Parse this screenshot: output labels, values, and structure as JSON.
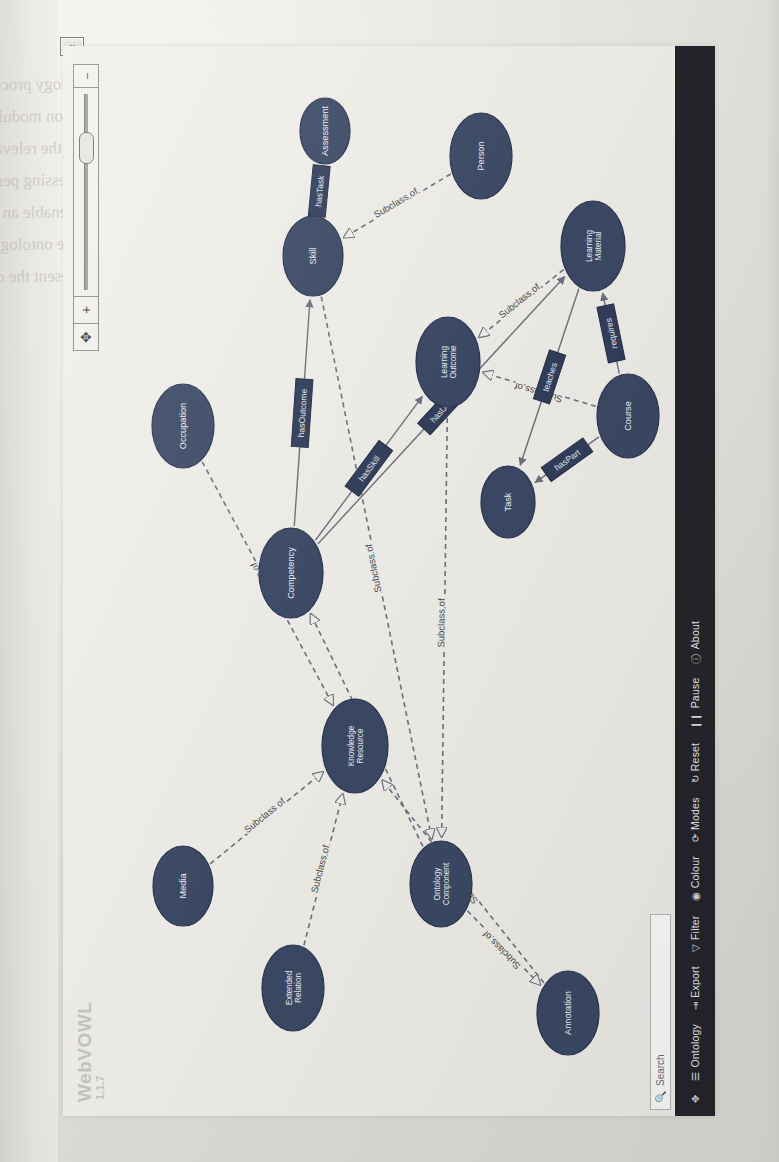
{
  "app": {
    "name": "WebVOWL",
    "version": "1.1.7",
    "collapse_toggle_glyph": "∨"
  },
  "search": {
    "icon": "search-icon",
    "placeholder": "Search",
    "value": ""
  },
  "toolbar": {
    "items": [
      {
        "glyph": "✥",
        "label": "",
        "name": "pan-icon"
      },
      {
        "glyph": "☰",
        "label": "Ontology",
        "name": "ontology"
      },
      {
        "glyph": "⇥",
        "label": "Export",
        "name": "export"
      },
      {
        "glyph": "▽",
        "label": "Filter",
        "name": "filter"
      },
      {
        "glyph": "◉",
        "label": "Colour",
        "name": "colour"
      },
      {
        "glyph": "⟳",
        "label": "Modes",
        "name": "modes"
      },
      {
        "glyph": "↻",
        "label": "Reset",
        "name": "reset"
      },
      {
        "glyph": "❙❙",
        "label": "Pause",
        "name": "pause"
      },
      {
        "glyph": "ⓘ",
        "label": "About",
        "name": "about"
      }
    ]
  },
  "zoom_control": {
    "center_glyph": "✥",
    "plus_label": "+",
    "minus_label": "–",
    "slider_value": 68
  },
  "colors": {
    "class_fill": "#3c4a66",
    "class_stroke": "#2b3550",
    "property_fill": "#33405c",
    "edge": "#6e7280",
    "canvas": "#f2f1ec",
    "sidebar": "#24262b"
  },
  "graph": {
    "edge_label_subclass": "Subclass of",
    "nodes": [
      {
        "id": "n1",
        "label": "Media",
        "cx": 230,
        "cy": 120,
        "rx": 40,
        "ry": 30
      },
      {
        "id": "n2",
        "label": "Extended Relation",
        "cx": 128,
        "cy": 230,
        "rx": 43,
        "ry": 31
      },
      {
        "id": "n3",
        "label": "Ontology Component",
        "cx": 232,
        "cy": 378,
        "rx": 43,
        "ry": 31
      },
      {
        "id": "n4",
        "label": "Annotation",
        "cx": 103,
        "cy": 505,
        "rx": 42,
        "ry": 31
      },
      {
        "id": "n5",
        "label": "Knowledge Resource",
        "cx": 370,
        "cy": 292,
        "rx": 47,
        "ry": 33
      },
      {
        "id": "n6",
        "label": "Competency",
        "cx": 543,
        "cy": 228,
        "rx": 45,
        "ry": 32
      },
      {
        "id": "n7",
        "label": "Occupation",
        "cx": 690,
        "cy": 120,
        "rx": 42,
        "ry": 31
      },
      {
        "id": "n8",
        "label": "Learning Outcome",
        "cx": 754,
        "cy": 385,
        "rx": 45,
        "ry": 32
      },
      {
        "id": "n9",
        "label": "Skill",
        "cx": 860,
        "cy": 250,
        "rx": 40,
        "ry": 30
      },
      {
        "id": "n10",
        "label": "Person",
        "cx": 960,
        "cy": 418,
        "rx": 43,
        "ry": 31
      },
      {
        "id": "n11",
        "label": "Learning Material",
        "cx": 870,
        "cy": 530,
        "rx": 45,
        "ry": 32
      },
      {
        "id": "n12",
        "label": "Course",
        "cx": 700,
        "cy": 565,
        "rx": 42,
        "ry": 31
      },
      {
        "id": "n13",
        "label": "Assessment",
        "cx": 985,
        "cy": 262,
        "rx": 33,
        "ry": 25
      },
      {
        "id": "n14",
        "label": "Task",
        "cx": 614,
        "cy": 445,
        "rx": 36,
        "ry": 27
      }
    ],
    "subclass_edges": [
      {
        "from": "n1",
        "to": "n5",
        "label": "Subclass of"
      },
      {
        "from": "n7",
        "to": "n5",
        "label": "Subclass of"
      },
      {
        "from": "n2",
        "to": "n5",
        "label": "Subclass of"
      },
      {
        "from": "n4",
        "to": "n5",
        "label": "Subclass of"
      },
      {
        "from": "n3",
        "to": "n4",
        "label": "Subclass of"
      },
      {
        "from": "n3",
        "to": "n6",
        "label": "Subclass of"
      },
      {
        "from": "n8",
        "to": "n3",
        "label": "Subclass of"
      },
      {
        "from": "n9",
        "to": "n3",
        "label": "Subclass of"
      },
      {
        "from": "n11",
        "to": "n8",
        "label": "Subclass of"
      },
      {
        "from": "n12",
        "to": "n8",
        "label": "Subclass of"
      },
      {
        "from": "n10",
        "to": "n9",
        "label": "Subclass of"
      },
      {
        "from": "n13",
        "to": "n9",
        "label": "Subclass of"
      }
    ],
    "object_properties": [
      {
        "from": "n6",
        "to": "n8",
        "label": "hasSkill"
      },
      {
        "from": "n6",
        "to": "n9",
        "label": "hasOutcome"
      },
      {
        "from": "n9",
        "to": "n13",
        "label": "hasTask"
      },
      {
        "from": "n12",
        "to": "n11",
        "label": "requires"
      },
      {
        "from": "n11",
        "to": "n14",
        "label": "teaches"
      },
      {
        "from": "n6",
        "to": "n11",
        "label": "hasUnit"
      },
      {
        "from": "n12",
        "to": "n14",
        "label": "hasPart"
      }
    ]
  },
  "ghost_text": [
    {
      "text": "ontology processing. These data now become the",
      "x": 96,
      "y": 74,
      "size": 17
    },
    {
      "text": "pection module. Recommendation impact of the  ontolo",
      "x": 96,
      "y": 106,
      "size": 17
    },
    {
      "text": "with the relevant partition and other annotations about the cla",
      "x": 96,
      "y": 138,
      "size": 17
    },
    {
      "text": "processing perspective. These help to indicate the authors, re",
      "x": 96,
      "y": 170,
      "size": 17
    },
    {
      "text": "and enable an evaluation of a partial result with  overlay",
      "x": 96,
      "y": 202,
      "size": 17
    },
    {
      "text": "of the ontology with respect to alignment methods.  Figu",
      "x": 96,
      "y": 234,
      "size": 17
    },
    {
      "text": "represent the ontology model.",
      "x": 96,
      "y": 266,
      "size": 17
    },
    {
      "text": "to the user interaction",
      "x": 200,
      "y": 498,
      "size": 13
    },
    {
      "text": "of the ontology",
      "x": 200,
      "y": 520,
      "size": 13
    },
    {
      "text": "the relation mapping",
      "x": 200,
      "y": 542,
      "size": 13
    },
    {
      "text": "in the next section",
      "x": 200,
      "y": 564,
      "size": 13
    },
    {
      "text": "Figure 4",
      "x": 710,
      "y": 1020,
      "size": 15
    }
  ]
}
